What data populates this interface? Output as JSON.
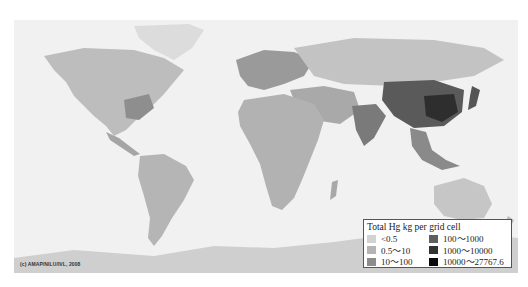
{
  "map": {
    "subject": "Global anthropogenic mercury emissions per grid cell",
    "background_color": "#f1f1f1",
    "land_base_color": "#c8c8c8"
  },
  "credit": "(c) AMAP/NILU/IVL, 2008",
  "legend": {
    "title": "Total Hg kg per grid cell",
    "items": [
      {
        "label": "<0.5",
        "color": "#d2d2d2"
      },
      {
        "label": "0.5～10",
        "color": "#b4b4b4"
      },
      {
        "label": "10～100",
        "color": "#8c8c8c"
      },
      {
        "label": "100～1000",
        "color": "#5f5f5f"
      },
      {
        "label": "1000～10000",
        "color": "#333333"
      },
      {
        "label": "10000～27767.6",
        "color": "#0a0a0a"
      }
    ]
  }
}
